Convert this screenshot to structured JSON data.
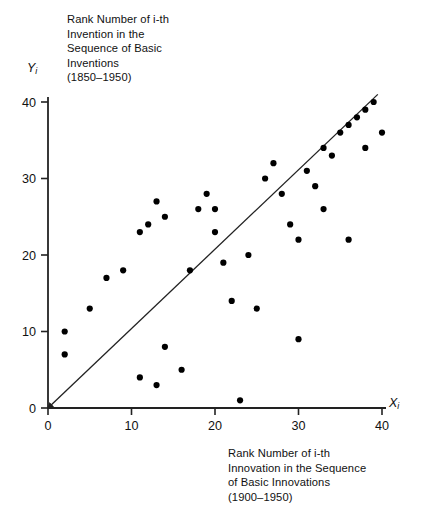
{
  "chart_data": {
    "type": "scatter",
    "title": "Rank Number of i-th Invention in the Sequence of Basic Inventions (1850–1950)",
    "xlabel": "Rank Number of i-th Innovation in the Sequence of Basic Innovations (1900–1950)",
    "ylabel": "Rank Number of i-th Invention in the Sequence of Basic Inventions (1850–1950)",
    "x_axis_symbol": "X",
    "y_axis_symbol": "Y",
    "axis_subscript": "i",
    "xlim": [
      0,
      42
    ],
    "ylim": [
      0,
      42
    ],
    "xticks": [
      0,
      10,
      20,
      30,
      40
    ],
    "yticks": [
      0,
      10,
      20,
      30,
      40
    ],
    "xticklabels": [
      "0",
      "10",
      "20",
      "30",
      "40"
    ],
    "yticklabels": [
      "0",
      "10",
      "20",
      "30",
      "40"
    ],
    "grid": false,
    "legend": null,
    "reference_line": {
      "name": "45-degree-line",
      "from": [
        0,
        0
      ],
      "to": [
        39.5,
        41.0
      ],
      "arrow_at": "origin"
    },
    "points": [
      [
        2,
        10
      ],
      [
        2,
        7
      ],
      [
        5,
        13
      ],
      [
        7,
        17
      ],
      [
        9,
        18
      ],
      [
        11,
        23
      ],
      [
        12,
        24
      ],
      [
        13,
        27
      ],
      [
        14,
        25
      ],
      [
        11,
        4
      ],
      [
        13,
        3
      ],
      [
        14,
        8
      ],
      [
        16,
        5
      ],
      [
        17,
        18
      ],
      [
        18,
        26
      ],
      [
        19,
        28
      ],
      [
        20,
        26
      ],
      [
        20,
        23
      ],
      [
        21,
        19
      ],
      [
        22,
        14
      ],
      [
        23,
        1
      ],
      [
        24,
        20
      ],
      [
        25,
        13
      ],
      [
        26,
        30
      ],
      [
        27,
        32
      ],
      [
        28,
        28
      ],
      [
        29,
        24
      ],
      [
        30,
        22
      ],
      [
        30,
        9
      ],
      [
        31,
        31
      ],
      [
        32,
        29
      ],
      [
        33,
        34
      ],
      [
        33,
        26
      ],
      [
        34,
        33
      ],
      [
        35,
        36
      ],
      [
        36,
        37
      ],
      [
        36,
        22
      ],
      [
        37,
        38
      ],
      [
        38,
        39
      ],
      [
        38,
        34
      ],
      [
        39,
        40
      ],
      [
        40,
        36
      ]
    ]
  },
  "captions": {
    "title_text": "Rank Number of i-th\nInvention in the\nSequence of Basic\nInventions\n(1850–1950)",
    "bottom_text": "Rank Number of i-th\nInnovation in the Sequence\nof Basic Innovations\n(1900–1950)"
  }
}
